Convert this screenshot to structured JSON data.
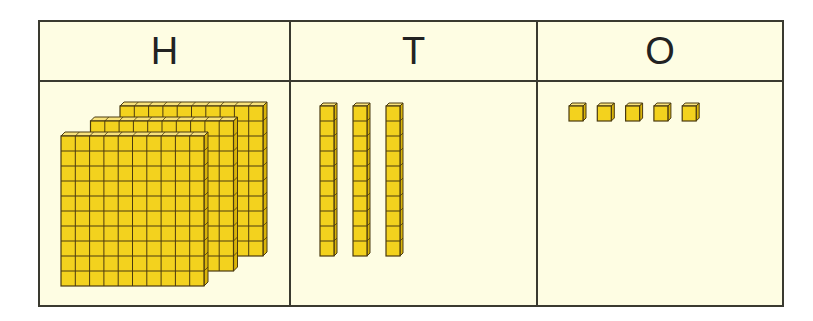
{
  "columns": [
    {
      "id": "hundreds",
      "header": "H",
      "block_type": "hundred-flat",
      "count": 3
    },
    {
      "id": "tens",
      "header": "T",
      "block_type": "ten-rod",
      "count": 3
    },
    {
      "id": "ones",
      "header": "O",
      "block_type": "unit-cube",
      "count": 5
    }
  ],
  "represented_number": 335,
  "colors": {
    "background": "#fefde3",
    "border": "#3a3a30",
    "block_front": "#f3d21e",
    "block_top": "#f8e27a",
    "block_side": "#d9b40a",
    "block_outline": "#4a3a10"
  }
}
